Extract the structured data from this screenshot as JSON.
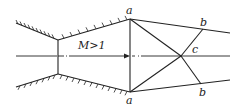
{
  "diagram": {
    "flow_label": "M>1",
    "points": {
      "a_top": "a",
      "a_bottom": "a",
      "b_top": "b",
      "b_bottom": "b",
      "c": "c"
    },
    "colors": {
      "stroke": "#222222",
      "background": "#ffffff"
    }
  }
}
